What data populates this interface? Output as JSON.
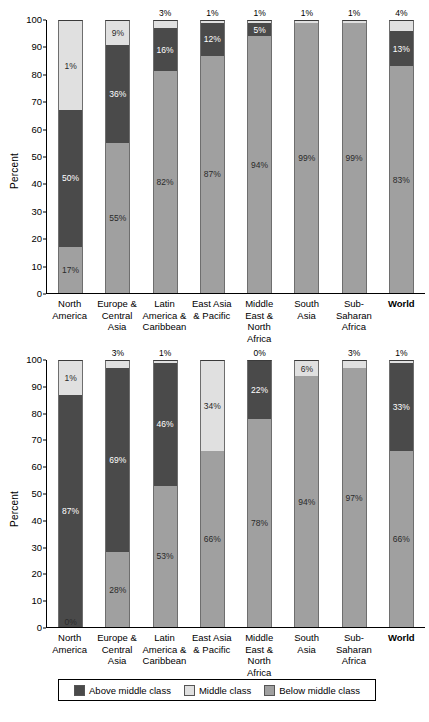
{
  "colors": {
    "above_middle_class": "#4a4a4a",
    "middle_class": "#e0e0e0",
    "below_middle_class": "#a0a0a0",
    "axis": "#000000",
    "background": "#ffffff"
  },
  "legend": {
    "items": [
      {
        "label": "Above middle class",
        "color": "#4a4a4a"
      },
      {
        "label": "Middle class",
        "color": "#e0e0e0"
      },
      {
        "label": "Below middle class",
        "color": "#a0a0a0"
      }
    ]
  },
  "y_axis": {
    "label": "Percent",
    "ticks": [
      "0",
      "10",
      "20",
      "30",
      "40",
      "50",
      "60",
      "70",
      "80",
      "90",
      "100"
    ]
  },
  "categories": [
    "North America",
    "Europe & Central Asia",
    "Latin America & Caribbean",
    "East Asia & Pacific",
    "Middle East & North Africa",
    "South Asia",
    "Sub-Saharan Africa",
    "World"
  ],
  "chart_data": [
    {
      "type": "bar",
      "stacked": true,
      "title": "",
      "xlabel": "",
      "ylabel": "Percent",
      "ylim": [
        0,
        100
      ],
      "grid": false,
      "legend_position": "bottom",
      "categories": [
        "North America",
        "Europe & Central Asia",
        "Latin America & Caribbean",
        "East Asia & Pacific",
        "Middle East & North Africa",
        "South Asia",
        "Sub-Saharan Africa",
        "World"
      ],
      "series": [
        {
          "name": "Below middle class",
          "color": "#a0a0a0",
          "values": [
            17,
            55,
            82,
            87,
            94,
            99,
            99,
            83
          ]
        },
        {
          "name": "Above middle class",
          "color": "#4a4a4a",
          "values": [
            50,
            36,
            16,
            12,
            5,
            0,
            0,
            13
          ]
        },
        {
          "name": "Middle class",
          "color": "#e0e0e0",
          "values": [
            33,
            9,
            3,
            1,
            1,
            1,
            1,
            4
          ]
        }
      ],
      "bars": [
        {
          "category": "North America",
          "below": {
            "value": 17,
            "label": "17%",
            "label_shown": true,
            "label_position": "inside"
          },
          "above": {
            "value": 50,
            "label": "50%",
            "label_shown": true,
            "label_position": "inside"
          },
          "middle": {
            "value": 33,
            "label": "1%",
            "label_shown": true,
            "label_position": "inside"
          }
        },
        {
          "category": "Europe & Central Asia",
          "below": {
            "value": 55,
            "label": "55%",
            "label_shown": true,
            "label_position": "inside"
          },
          "above": {
            "value": 36,
            "label": "36%",
            "label_shown": true,
            "label_position": "inside"
          },
          "middle": {
            "value": 9,
            "label": "9%",
            "label_shown": true,
            "label_position": "inside"
          }
        },
        {
          "category": "Latin America & Caribbean",
          "below": {
            "value": 82,
            "label": "82%",
            "label_shown": true,
            "label_position": "inside"
          },
          "above": {
            "value": 16,
            "label": "16%",
            "label_shown": true,
            "label_position": "inside"
          },
          "middle": {
            "value": 3,
            "label": "3%",
            "label_shown": true,
            "label_position": "above"
          }
        },
        {
          "category": "East Asia & Pacific",
          "below": {
            "value": 87,
            "label": "87%",
            "label_shown": true,
            "label_position": "inside"
          },
          "above": {
            "value": 12,
            "label": "12%",
            "label_shown": true,
            "label_position": "inside"
          },
          "middle": {
            "value": 1,
            "label": "1%",
            "label_shown": true,
            "label_position": "above"
          }
        },
        {
          "category": "Middle East & North Africa",
          "below": {
            "value": 94,
            "label": "94%",
            "label_shown": true,
            "label_position": "inside"
          },
          "above": {
            "value": 5,
            "label": "5%",
            "label_shown": true,
            "label_position": "inside"
          },
          "middle": {
            "value": 1,
            "label": "1%",
            "label_shown": true,
            "label_position": "above"
          }
        },
        {
          "category": "South Asia",
          "below": {
            "value": 99,
            "label": "99%",
            "label_shown": true,
            "label_position": "inside"
          },
          "above": {
            "value": 0,
            "label": "",
            "label_shown": false,
            "label_position": "inside"
          },
          "middle": {
            "value": 1,
            "label": "1%",
            "label_shown": true,
            "label_position": "above"
          }
        },
        {
          "category": "Sub-Saharan Africa",
          "below": {
            "value": 99,
            "label": "99%",
            "label_shown": true,
            "label_position": "inside"
          },
          "above": {
            "value": 0,
            "label": "",
            "label_shown": false,
            "label_position": "inside"
          },
          "middle": {
            "value": 1,
            "label": "1%",
            "label_shown": true,
            "label_position": "above"
          }
        },
        {
          "category": "World",
          "below": {
            "value": 83,
            "label": "83%",
            "label_shown": true,
            "label_position": "inside"
          },
          "above": {
            "value": 13,
            "label": "13%",
            "label_shown": true,
            "label_position": "inside"
          },
          "middle": {
            "value": 4,
            "label": "4%",
            "label_shown": true,
            "label_position": "above"
          }
        }
      ]
    },
    {
      "type": "bar",
      "stacked": true,
      "title": "",
      "xlabel": "",
      "ylabel": "Percent",
      "ylim": [
        0,
        100
      ],
      "grid": false,
      "legend_position": "bottom",
      "categories": [
        "North America",
        "Europe & Central Asia",
        "Latin America & Caribbean",
        "East Asia & Pacific",
        "Middle East & North Africa",
        "South Asia",
        "Sub-Saharan Africa",
        "World"
      ],
      "series": [
        {
          "name": "Below middle class",
          "color": "#a0a0a0",
          "values": [
            0,
            28,
            53,
            66,
            78,
            94,
            97,
            66
          ]
        },
        {
          "name": "Above middle class",
          "color": "#4a4a4a",
          "values": [
            87,
            69,
            46,
            0,
            22,
            0,
            0,
            33
          ]
        },
        {
          "name": "Middle class",
          "color": "#e0e0e0",
          "values": [
            13,
            3,
            1,
            34,
            0,
            6,
            3,
            1
          ]
        }
      ],
      "bars": [
        {
          "category": "North America",
          "below": {
            "value": 0,
            "label": "0%",
            "label_shown": true,
            "label_position": "bottom"
          },
          "above": {
            "value": 87,
            "label": "87%",
            "label_shown": true,
            "label_position": "inside"
          },
          "middle": {
            "value": 13,
            "label": "1%",
            "label_shown": true,
            "label_position": "inside"
          }
        },
        {
          "category": "Europe & Central Asia",
          "below": {
            "value": 28,
            "label": "28%",
            "label_shown": true,
            "label_position": "inside"
          },
          "above": {
            "value": 69,
            "label": "69%",
            "label_shown": true,
            "label_position": "inside"
          },
          "middle": {
            "value": 3,
            "label": "3%",
            "label_shown": true,
            "label_position": "above"
          }
        },
        {
          "category": "Latin America & Caribbean",
          "below": {
            "value": 53,
            "label": "53%",
            "label_shown": true,
            "label_position": "inside"
          },
          "above": {
            "value": 46,
            "label": "46%",
            "label_shown": true,
            "label_position": "inside"
          },
          "middle": {
            "value": 1,
            "label": "1%",
            "label_shown": true,
            "label_position": "above"
          }
        },
        {
          "category": "East Asia & Pacific",
          "below": {
            "value": 66,
            "label": "66%",
            "label_shown": true,
            "label_position": "inside"
          },
          "above": {
            "value": 0,
            "label": "",
            "label_shown": false,
            "label_position": "inside"
          },
          "middle": {
            "value": 34,
            "label": "34%",
            "label_shown": true,
            "label_position": "inside"
          }
        },
        {
          "category": "Middle East & North Africa",
          "below": {
            "value": 78,
            "label": "78%",
            "label_shown": true,
            "label_position": "inside"
          },
          "above": {
            "value": 22,
            "label": "22%",
            "label_shown": true,
            "label_position": "inside"
          },
          "middle": {
            "value": 0,
            "label": "0%",
            "label_shown": true,
            "label_position": "above"
          }
        },
        {
          "category": "South Asia",
          "below": {
            "value": 94,
            "label": "94%",
            "label_shown": true,
            "label_position": "inside"
          },
          "above": {
            "value": 0,
            "label": "",
            "label_shown": false,
            "label_position": "inside"
          },
          "middle": {
            "value": 6,
            "label": "6%",
            "label_shown": true,
            "label_position": "inside"
          }
        },
        {
          "category": "Sub-Saharan Africa",
          "below": {
            "value": 97,
            "label": "97%",
            "label_shown": true,
            "label_position": "inside"
          },
          "above": {
            "value": 0,
            "label": "",
            "label_shown": false,
            "label_position": "inside"
          },
          "middle": {
            "value": 3,
            "label": "3%",
            "label_shown": true,
            "label_position": "above"
          }
        },
        {
          "category": "World",
          "below": {
            "value": 66,
            "label": "66%",
            "label_shown": true,
            "label_position": "inside"
          },
          "above": {
            "value": 33,
            "label": "33%",
            "label_shown": true,
            "label_position": "inside"
          },
          "middle": {
            "value": 1,
            "label": "1%",
            "label_shown": true,
            "label_position": "above"
          }
        }
      ]
    }
  ]
}
